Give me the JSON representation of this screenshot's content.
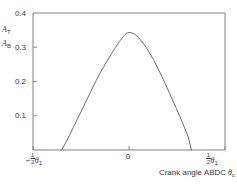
{
  "chart_data": {
    "type": "line",
    "title": "",
    "subtitle": "",
    "xlabel": "Crank angle ABDC",
    "xlabel_symbol": "θ",
    "xlabel_symbol_sub": "c",
    "ylabel_line1_base": "A",
    "ylabel_line1_sub": "T",
    "ylabel_line2_base": "A",
    "ylabel_line2_sub": "B",
    "ylim": [
      0,
      0.4
    ],
    "yticks": [
      0.1,
      0.2,
      0.3,
      0.4
    ],
    "ytick_labels": [
      "0.1",
      "0.2",
      "0.3",
      "0.4"
    ],
    "xticks": [
      -1,
      0,
      1
    ],
    "xtick_labels": [
      "-½θ₁",
      "0",
      "½θ₁"
    ],
    "xtick_left_sign": "−",
    "xtick_left_num": "1",
    "xtick_left_den": "2",
    "xtick_left_symbol": "θ",
    "xtick_left_sub": "1",
    "xtick_center": "0",
    "xtick_right_num": "1",
    "xtick_right_den": "2",
    "xtick_right_symbol": "θ",
    "xtick_right_sub": "1",
    "grid": false,
    "legend": null,
    "series": [
      {
        "name": "valve open area ratio",
        "peak_value": 0.344,
        "peak_x": 0.0,
        "zero_crossings": [
          -0.69,
          0.645
        ],
        "x": [
          -0.7,
          -0.66,
          -0.62,
          -0.58,
          -0.54,
          -0.5,
          -0.46,
          -0.42,
          -0.38,
          -0.34,
          -0.3,
          -0.26,
          -0.22,
          -0.18,
          -0.14,
          -0.1,
          -0.06,
          -0.02,
          0.02,
          0.06,
          0.1,
          0.14,
          0.18,
          0.22,
          0.26,
          0.3,
          0.34,
          0.38,
          0.42,
          0.46,
          0.5,
          0.54,
          0.58,
          0.62,
          0.65
        ],
        "values": [
          0.0,
          0.021,
          0.043,
          0.066,
          0.089,
          0.112,
          0.135,
          0.158,
          0.181,
          0.204,
          0.225,
          0.245,
          0.264,
          0.282,
          0.3,
          0.317,
          0.331,
          0.342,
          0.343,
          0.338,
          0.328,
          0.315,
          0.299,
          0.281,
          0.261,
          0.239,
          0.216,
          0.192,
          0.167,
          0.142,
          0.117,
          0.091,
          0.064,
          0.035,
          0.0
        ]
      }
    ],
    "axis_color": "#808080",
    "curve_color": "#6b6b6b",
    "background": "#ffffff"
  },
  "geometry": {
    "plot_left": 33,
    "plot_right": 225,
    "plot_top": 13,
    "plot_bottom": 150
  }
}
